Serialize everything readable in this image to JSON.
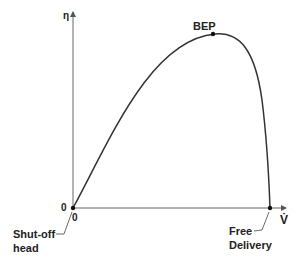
{
  "diagram": {
    "type": "pump-efficiency-curve",
    "y_axis": {
      "label": "η"
    },
    "x_axis": {
      "label": "V̇"
    },
    "origin": {
      "x_label": "0",
      "y_label": "0"
    },
    "points": {
      "bep": {
        "label": "BEP"
      },
      "shutoff": {
        "label_line1": "Shut-off",
        "label_line2": "head"
      },
      "free_delivery": {
        "label_line1": "Free",
        "label_line2": "Delivery"
      }
    },
    "colors": {
      "line": "#333333",
      "axis": "#555555",
      "text": "#222222"
    }
  }
}
